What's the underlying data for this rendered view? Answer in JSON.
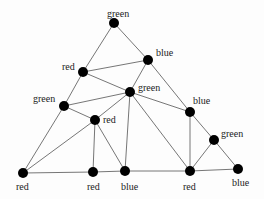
{
  "diagram": {
    "type": "graph-coloring-triangulation",
    "nodes": [
      {
        "id": "n_top",
        "label": "green",
        "x": 114,
        "y": 23,
        "lx": 107,
        "ly": 9
      },
      {
        "id": "n_blue_ur",
        "label": "blue",
        "x": 148,
        "y": 60,
        "lx": 156,
        "ly": 48
      },
      {
        "id": "n_red_ul",
        "label": "red",
        "x": 83,
        "y": 72,
        "lx": 62,
        "ly": 62
      },
      {
        "id": "n_green_c",
        "label": "green",
        "x": 130,
        "y": 92,
        "lx": 138,
        "ly": 83
      },
      {
        "id": "n_green_l",
        "label": "green",
        "x": 64,
        "y": 106,
        "lx": 33,
        "ly": 94
      },
      {
        "id": "n_red_m",
        "label": "red",
        "x": 95,
        "y": 120,
        "lx": 103,
        "ly": 115
      },
      {
        "id": "n_blue_r",
        "label": "blue",
        "x": 190,
        "y": 112,
        "lx": 193,
        "ly": 96
      },
      {
        "id": "n_green_r",
        "label": "green",
        "x": 214,
        "y": 140,
        "lx": 221,
        "ly": 129
      },
      {
        "id": "n_red_bl",
        "label": "red",
        "x": 23,
        "y": 173,
        "lx": 16,
        "ly": 182
      },
      {
        "id": "n_red_b",
        "label": "red",
        "x": 93,
        "y": 172,
        "lx": 87,
        "ly": 182
      },
      {
        "id": "n_blue_bm",
        "label": "blue",
        "x": 125,
        "y": 171,
        "lx": 121,
        "ly": 182
      },
      {
        "id": "n_red_br",
        "label": "red",
        "x": 190,
        "y": 171,
        "lx": 183,
        "ly": 182
      },
      {
        "id": "n_blue_brr",
        "label": "blue",
        "x": 238,
        "y": 169,
        "lx": 232,
        "ly": 178
      }
    ],
    "edges": [
      [
        "n_top",
        "n_red_ul"
      ],
      [
        "n_top",
        "n_blue_ur"
      ],
      [
        "n_red_ul",
        "n_blue_ur"
      ],
      [
        "n_red_ul",
        "n_green_c"
      ],
      [
        "n_red_ul",
        "n_green_l"
      ],
      [
        "n_blue_ur",
        "n_green_c"
      ],
      [
        "n_blue_ur",
        "n_blue_r"
      ],
      [
        "n_green_l",
        "n_green_c"
      ],
      [
        "n_green_l",
        "n_red_m"
      ],
      [
        "n_green_l",
        "n_red_bl"
      ],
      [
        "n_green_c",
        "n_red_m"
      ],
      [
        "n_green_c",
        "n_blue_bm"
      ],
      [
        "n_green_c",
        "n_red_br"
      ],
      [
        "n_green_c",
        "n_blue_r"
      ],
      [
        "n_red_m",
        "n_red_b"
      ],
      [
        "n_red_m",
        "n_blue_bm"
      ],
      [
        "n_red_m",
        "n_red_bl"
      ],
      [
        "n_blue_r",
        "n_red_br"
      ],
      [
        "n_blue_r",
        "n_green_r"
      ],
      [
        "n_green_r",
        "n_red_br"
      ],
      [
        "n_green_r",
        "n_blue_brr"
      ],
      [
        "n_red_bl",
        "n_red_b"
      ],
      [
        "n_red_b",
        "n_blue_bm"
      ],
      [
        "n_blue_bm",
        "n_red_br"
      ],
      [
        "n_red_br",
        "n_blue_brr"
      ]
    ],
    "style": {
      "node_color": "#000000",
      "edge_color": "#666666",
      "node_radius": 5
    }
  }
}
